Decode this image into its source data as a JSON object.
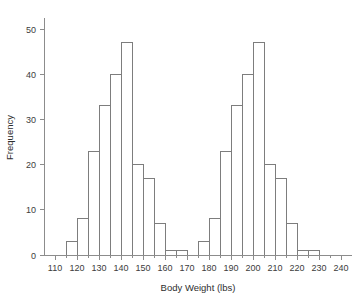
{
  "chart_data": {
    "type": "bar",
    "title": "",
    "subtitle": "",
    "xlabel": "Body Weight (lbs)",
    "ylabel": "Frequency",
    "xlim": [
      105,
      245
    ],
    "ylim": [
      0,
      52
    ],
    "grid": false,
    "legend": null,
    "bin_width": 5,
    "x_tick_labels": [
      "110",
      "120",
      "130",
      "140",
      "150",
      "160",
      "170",
      "180",
      "190",
      "200",
      "210",
      "220",
      "230",
      "240"
    ],
    "x_tick_values": [
      110,
      120,
      130,
      140,
      150,
      160,
      170,
      180,
      190,
      200,
      210,
      220,
      230,
      240
    ],
    "x_minor_tick_values": [
      115,
      125,
      135,
      145,
      155,
      165,
      175,
      185,
      195,
      205,
      215,
      225,
      235
    ],
    "y_tick_labels": [
      "0",
      "10",
      "20",
      "30",
      "40",
      "50"
    ],
    "y_tick_values": [
      0,
      10,
      20,
      30,
      40,
      50
    ],
    "bins": [
      {
        "start": 115,
        "end": 120,
        "value": 3
      },
      {
        "start": 120,
        "end": 125,
        "value": 8
      },
      {
        "start": 125,
        "end": 130,
        "value": 23
      },
      {
        "start": 130,
        "end": 135,
        "value": 33
      },
      {
        "start": 135,
        "end": 140,
        "value": 40
      },
      {
        "start": 140,
        "end": 145,
        "value": 47
      },
      {
        "start": 145,
        "end": 150,
        "value": 20
      },
      {
        "start": 150,
        "end": 155,
        "value": 17
      },
      {
        "start": 155,
        "end": 160,
        "value": 7
      },
      {
        "start": 160,
        "end": 165,
        "value": 1
      },
      {
        "start": 165,
        "end": 170,
        "value": 1
      },
      {
        "start": 175,
        "end": 180,
        "value": 3
      },
      {
        "start": 180,
        "end": 185,
        "value": 8
      },
      {
        "start": 185,
        "end": 190,
        "value": 23
      },
      {
        "start": 190,
        "end": 195,
        "value": 33
      },
      {
        "start": 195,
        "end": 200,
        "value": 40
      },
      {
        "start": 200,
        "end": 205,
        "value": 47
      },
      {
        "start": 205,
        "end": 210,
        "value": 20
      },
      {
        "start": 210,
        "end": 215,
        "value": 17
      },
      {
        "start": 215,
        "end": 220,
        "value": 7
      },
      {
        "start": 220,
        "end": 225,
        "value": 1
      },
      {
        "start": 225,
        "end": 230,
        "value": 1
      }
    ],
    "colors": {
      "bar_stroke": "#7d7d7d",
      "bar_fill": "none",
      "axis": "#8c8c8c",
      "text": "#3c3c3c",
      "background": "#ffffff"
    }
  }
}
